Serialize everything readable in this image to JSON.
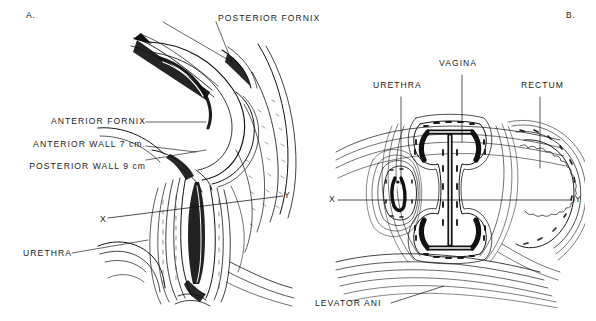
{
  "figure": {
    "background_color": "#ffffff",
    "ink_color": "#111111",
    "width": 596,
    "height": 321
  },
  "panels": [
    {
      "id": "A",
      "marker": "A.",
      "view": "midsagittal-section",
      "labels": [
        {
          "name": "posterior-fornix",
          "text": "POSTERIOR FORNIX"
        },
        {
          "name": "anterior-fornix",
          "text": "ANTERIOR FORNIX"
        },
        {
          "name": "anterior-wall",
          "text": "ANTERIOR WALL  7 cm."
        },
        {
          "name": "posterior-wall",
          "text": "POSTERIOR WALL 9 cm"
        },
        {
          "name": "urethra",
          "text": "URETHRA"
        }
      ],
      "axis_marks": [
        {
          "name": "x",
          "text": "X"
        },
        {
          "name": "y",
          "text": "Y"
        }
      ]
    },
    {
      "id": "B",
      "marker": "B.",
      "view": "transverse-section",
      "labels": [
        {
          "name": "urethra",
          "text": "URETHRA"
        },
        {
          "name": "vagina",
          "text": "VAGINA"
        },
        {
          "name": "rectum",
          "text": "RECTUM"
        },
        {
          "name": "levator-ani",
          "text": "LEVATOR ANI"
        }
      ],
      "axis_marks": [
        {
          "name": "x",
          "text": "X"
        },
        {
          "name": "y",
          "text": "Y"
        }
      ]
    }
  ],
  "measurements": {
    "anterior_wall_length": "7 cm.",
    "posterior_wall_length": "9 cm"
  }
}
